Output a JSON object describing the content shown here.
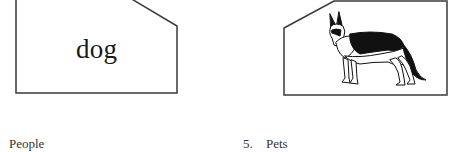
{
  "cards": [
    {
      "id": "word-card",
      "text": "dog"
    },
    {
      "id": "picture-card",
      "image": "german-shepherd-dog-illustration"
    }
  ],
  "labels": {
    "left": "People",
    "right_number": "5.",
    "right_text": "Pets"
  },
  "colors": {
    "stroke": "#3a3a3a",
    "text": "#1a1a1a",
    "background": "#ffffff"
  }
}
